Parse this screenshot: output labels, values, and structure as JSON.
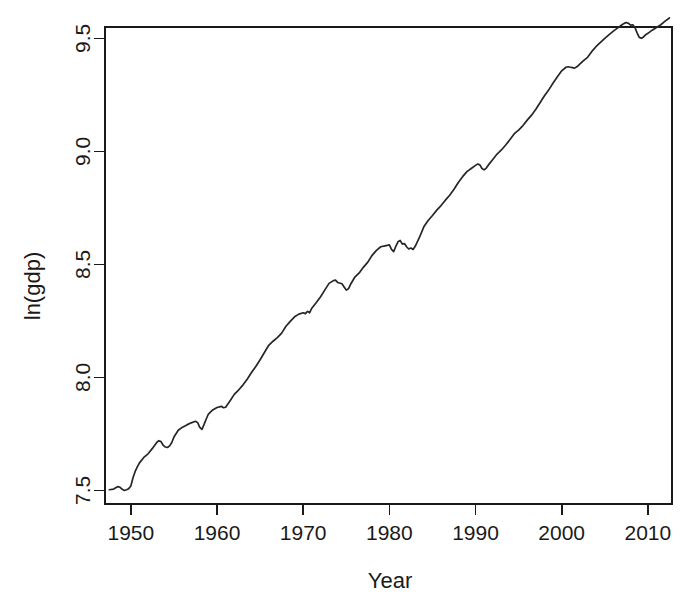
{
  "chart_data": {
    "type": "line",
    "title": "",
    "xlabel": "Year",
    "ylabel": "ln(gdp)",
    "xlim": [
      1947.0,
      2012.8
    ],
    "ylim": [
      7.44,
      9.55
    ],
    "grid": false,
    "legend": null,
    "line_color": "#262626",
    "background_color": "#ffffff",
    "axis_color": "#1a1a1a",
    "x_ticks": [
      1950,
      1960,
      1970,
      1980,
      1990,
      2000,
      2010
    ],
    "x_tick_labels": [
      "1950",
      "1960",
      "1970",
      "1980",
      "1990",
      "2000",
      "2010"
    ],
    "y_ticks": [
      7.5,
      8.0,
      8.5,
      9.0,
      9.5
    ],
    "y_tick_labels": [
      "7.5",
      "8.0",
      "8.5",
      "9.0",
      "9.5"
    ],
    "series": [
      {
        "name": "ln(gdp)",
        "x": [
          1947.5,
          1948.0,
          1948.25,
          1948.5,
          1948.75,
          1949.0,
          1949.25,
          1949.5,
          1949.75,
          1950.0,
          1950.25,
          1950.5,
          1950.75,
          1951.0,
          1951.5,
          1952.0,
          1952.5,
          1953.0,
          1953.25,
          1953.5,
          1953.75,
          1954.0,
          1954.25,
          1954.5,
          1954.75,
          1955.0,
          1955.5,
          1956.0,
          1956.5,
          1957.0,
          1957.5,
          1957.75,
          1958.0,
          1958.25,
          1958.5,
          1958.75,
          1959.0,
          1959.5,
          1960.0,
          1960.5,
          1960.75,
          1961.0,
          1961.5,
          1962.0,
          1962.5,
          1963.0,
          1963.5,
          1964.0,
          1964.5,
          1965.0,
          1965.5,
          1966.0,
          1966.5,
          1967.0,
          1967.5,
          1968.0,
          1968.5,
          1969.0,
          1969.5,
          1970.0,
          1970.25,
          1970.5,
          1970.75,
          1971.0,
          1971.5,
          1972.0,
          1972.5,
          1973.0,
          1973.5,
          1973.75,
          1974.0,
          1974.5,
          1974.75,
          1975.0,
          1975.25,
          1975.5,
          1976.0,
          1976.5,
          1977.0,
          1977.5,
          1978.0,
          1978.5,
          1979.0,
          1979.5,
          1980.0,
          1980.25,
          1980.5,
          1980.75,
          1981.0,
          1981.25,
          1981.5,
          1981.75,
          1982.0,
          1982.25,
          1982.5,
          1982.75,
          1983.0,
          1983.5,
          1984.0,
          1984.5,
          1985.0,
          1985.5,
          1986.0,
          1986.5,
          1987.0,
          1987.5,
          1988.0,
          1988.5,
          1989.0,
          1989.5,
          1990.0,
          1990.25,
          1990.5,
          1990.75,
          1991.0,
          1991.25,
          1991.5,
          1992.0,
          1992.5,
          1993.0,
          1993.5,
          1994.0,
          1994.5,
          1995.0,
          1995.5,
          1996.0,
          1996.5,
          1997.0,
          1997.5,
          1998.0,
          1998.5,
          1999.0,
          1999.5,
          2000.0,
          2000.5,
          2000.75,
          2001.0,
          2001.25,
          2001.5,
          2001.75,
          2002.0,
          2002.5,
          2003.0,
          2003.5,
          2004.0,
          2004.5,
          2005.0,
          2005.5,
          2006.0,
          2006.5,
          2007.0,
          2007.25,
          2007.5,
          2007.75,
          2008.0,
          2008.25,
          2008.5,
          2008.75,
          2009.0,
          2009.25,
          2009.5,
          2009.75,
          2010.0,
          2010.5,
          2011.0,
          2011.5,
          2012.0,
          2012.5
        ],
        "y": [
          7.503,
          7.506,
          7.512,
          7.517,
          7.514,
          7.505,
          7.5,
          7.503,
          7.508,
          7.52,
          7.556,
          7.584,
          7.604,
          7.622,
          7.646,
          7.662,
          7.686,
          7.712,
          7.72,
          7.716,
          7.7,
          7.692,
          7.69,
          7.697,
          7.712,
          7.736,
          7.766,
          7.78,
          7.79,
          7.799,
          7.806,
          7.8,
          7.779,
          7.77,
          7.792,
          7.816,
          7.838,
          7.856,
          7.867,
          7.872,
          7.866,
          7.868,
          7.896,
          7.925,
          7.944,
          7.966,
          7.992,
          8.022,
          8.048,
          8.078,
          8.11,
          8.142,
          8.16,
          8.176,
          8.196,
          8.226,
          8.248,
          8.268,
          8.28,
          8.286,
          8.282,
          8.292,
          8.286,
          8.306,
          8.33,
          8.356,
          8.386,
          8.416,
          8.428,
          8.43,
          8.42,
          8.414,
          8.4,
          8.386,
          8.392,
          8.412,
          8.444,
          8.462,
          8.488,
          8.51,
          8.54,
          8.562,
          8.578,
          8.582,
          8.586,
          8.566,
          8.556,
          8.58,
          8.6,
          8.606,
          8.59,
          8.592,
          8.578,
          8.568,
          8.572,
          8.566,
          8.58,
          8.62,
          8.666,
          8.694,
          8.716,
          8.74,
          8.76,
          8.784,
          8.806,
          8.832,
          8.862,
          8.888,
          8.91,
          8.924,
          8.938,
          8.944,
          8.94,
          8.924,
          8.918,
          8.926,
          8.94,
          8.964,
          8.988,
          9.006,
          9.028,
          9.052,
          9.078,
          9.094,
          9.114,
          9.138,
          9.16,
          9.186,
          9.216,
          9.246,
          9.272,
          9.302,
          9.33,
          9.356,
          9.372,
          9.374,
          9.372,
          9.37,
          9.368,
          9.374,
          9.382,
          9.4,
          9.416,
          9.442,
          9.464,
          9.482,
          9.5,
          9.516,
          9.532,
          9.546,
          9.56,
          9.566,
          9.57,
          9.566,
          9.558,
          9.56,
          9.548,
          9.524,
          9.504,
          9.5,
          9.506,
          9.516,
          9.522,
          9.536,
          9.548,
          9.56,
          9.576,
          9.59
        ]
      }
    ]
  }
}
